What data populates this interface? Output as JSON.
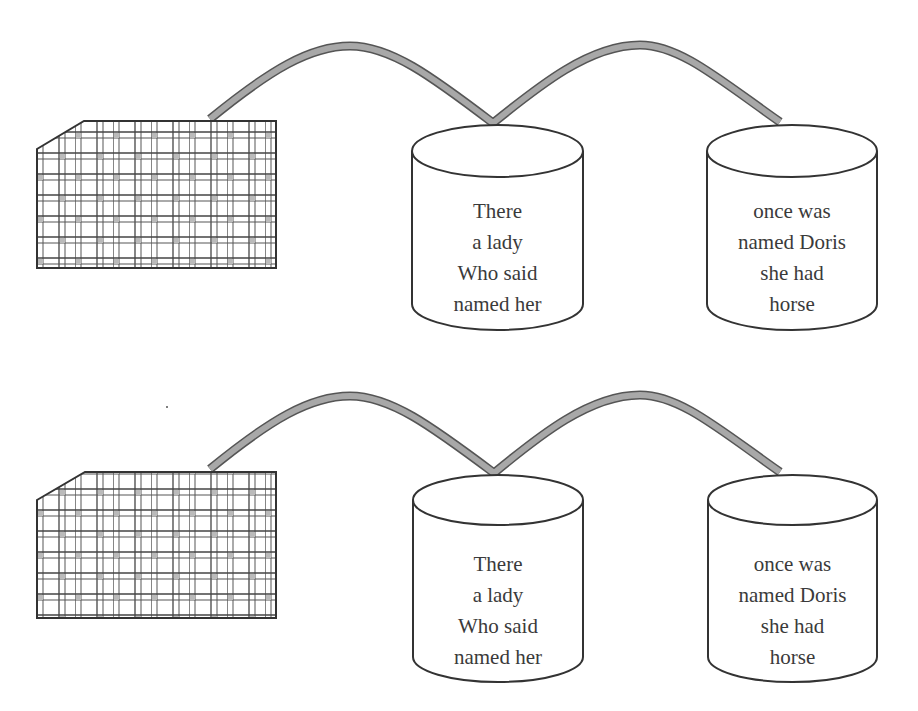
{
  "diagram": {
    "colors": {
      "background": "#ffffff",
      "stroke": "#333333",
      "cable": "#9a9a9a",
      "cable_edge": "#555555",
      "text": "#3a3a3a"
    },
    "panels": [
      {
        "id": "top",
        "grid_block": {
          "label": ""
        },
        "cylinders": [
          {
            "lines": [
              "There",
              "a lady",
              "Who said",
              "named her"
            ]
          },
          {
            "lines": [
              "once was",
              "named Doris",
              "she had",
              "horse"
            ]
          }
        ]
      },
      {
        "id": "bottom",
        "grid_block": {
          "label": ""
        },
        "cylinders": [
          {
            "lines": [
              "There",
              "a lady",
              "Who said",
              "named her"
            ]
          },
          {
            "lines": [
              "once was",
              "named Doris",
              "she had",
              "horse"
            ]
          }
        ]
      }
    ]
  }
}
